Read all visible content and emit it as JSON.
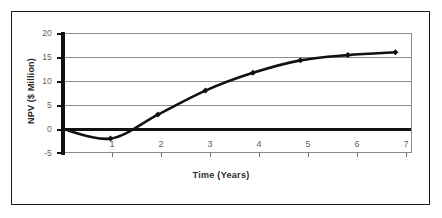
{
  "chart_data": {
    "type": "line",
    "title": "",
    "subtitle": "",
    "xlabel": "Time (Years)",
    "ylabel": "NPV ($ Million)",
    "xlim": [
      0,
      7.35
    ],
    "ylim": [
      -5,
      20
    ],
    "xticks": [
      1,
      2,
      3,
      4,
      5,
      6,
      7
    ],
    "xtick_labels": [
      "1",
      "2",
      "3",
      "4",
      "5",
      "6",
      "7"
    ],
    "yticks": [
      -5,
      0,
      5,
      10,
      15,
      20
    ],
    "ytick_labels": [
      "-5",
      "0",
      "5",
      "10",
      "15",
      "20"
    ],
    "grid": "horizontal",
    "legend": "none",
    "zero_line": 0,
    "series": [
      {
        "name": "NPV",
        "x": [
          0,
          1,
          2,
          3,
          4,
          5,
          6,
          7
        ],
        "values": [
          0,
          -2.0,
          3.0,
          8.0,
          11.7,
          14.3,
          15.4,
          16.0
        ],
        "marker": "diamond",
        "color": "#111111",
        "line_width": 2.6
      }
    ],
    "annotations": []
  },
  "axes": {
    "y_title": "NPV ($ Million)",
    "x_title": "Time (Years)"
  },
  "colors": {
    "line": "#111111",
    "marker": "#111111",
    "grid": "#8c8c8c",
    "zero_line": "#111111",
    "axis_spine": "#111111",
    "frame": "#1a1a1a",
    "tick_text": "#5f5f5f",
    "title_text": "#2b2b2b",
    "background": "#ffffff"
  }
}
